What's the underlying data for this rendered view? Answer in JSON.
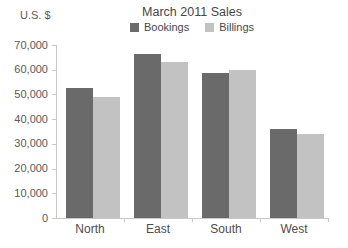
{
  "chart_data": {
    "type": "bar",
    "title": "March 2011 Sales",
    "ylabel": "U.S. $",
    "xlabel": "",
    "categories": [
      "North",
      "East",
      "South",
      "West"
    ],
    "series": [
      {
        "name": "Bookings",
        "color": "#6a6a6a",
        "values": [
          52500,
          66500,
          58500,
          36000
        ]
      },
      {
        "name": "Billings",
        "color": "#c2c2c2",
        "values": [
          49000,
          63000,
          60000,
          34000
        ]
      }
    ],
    "ylim": [
      0,
      70000
    ],
    "ytick_interval": 10000,
    "ytick_labels": [
      "0",
      "10,000",
      "20,000",
      "30,000",
      "40,000",
      "50,000",
      "60,000",
      "70,000"
    ],
    "grid": false,
    "legend_position": "top-center"
  },
  "colors": {
    "axis_line": "#c9c9c9",
    "tick_text": "#595959",
    "title_text": "#474747",
    "category_text": "#4d4d4d",
    "background": "#ffffff"
  }
}
